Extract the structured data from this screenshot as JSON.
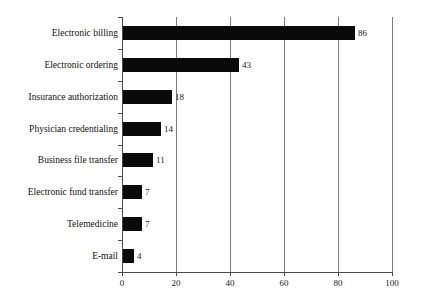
{
  "chart_data": {
    "type": "bar",
    "orientation": "horizontal",
    "title": "",
    "subtitle": "",
    "xlabel": "",
    "ylabel": "",
    "categories": [
      "Electronic billing",
      "Electronic ordering",
      "Insurance authorization",
      "Physician credentialing",
      "Business file transfer",
      "Electronic fund transfer",
      "Telemedicine",
      "E-mail"
    ],
    "values": [
      86,
      43,
      18,
      14,
      11,
      7,
      7,
      4
    ],
    "value_labels": [
      "86",
      "43",
      "18",
      "14",
      "11",
      "7",
      "7",
      "4"
    ],
    "xlim": [
      0,
      100
    ],
    "xticks": [
      0,
      20,
      40,
      60,
      80,
      100
    ],
    "xtick_labels": [
      "0",
      "20",
      "40",
      "60",
      "80",
      "100"
    ],
    "grid": true,
    "grid_axis": "x",
    "legend": false,
    "bar_color": "#0a0a0a",
    "axis_color": "#4a4a4a",
    "grid_color": "#7d7d7d",
    "background_color": "#ffffff"
  }
}
